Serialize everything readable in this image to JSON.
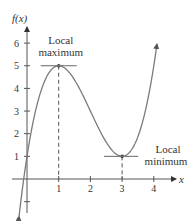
{
  "chart_data": {
    "type": "line",
    "title": "",
    "function": "f(x) = x^3 - 6x^2 + 9x + 1",
    "xlabel": "x",
    "ylabel": "f(x)",
    "x_ticks": [
      1,
      2,
      3,
      4
    ],
    "y_ticks": [
      -1,
      1,
      2,
      3,
      4,
      5,
      6
    ],
    "y_tick_labels": [
      "1",
      "2",
      "3",
      "4",
      "5",
      "6"
    ],
    "x_tick_labels": [
      "1",
      "2",
      "3",
      "4"
    ],
    "xlim": [
      -0.4,
      4.5
    ],
    "ylim": [
      -1.5,
      6.7
    ],
    "grid": false,
    "curve_x_range": [
      -0.25,
      4.1
    ],
    "points": [
      {
        "x": -0.25,
        "y": -1.64
      },
      {
        "x": 0,
        "y": 1
      },
      {
        "x": 1,
        "y": 5
      },
      {
        "x": 2,
        "y": 3
      },
      {
        "x": 3,
        "y": 1
      },
      {
        "x": 4,
        "y": 5
      },
      {
        "x": 4.1,
        "y": 5.96
      }
    ],
    "annotations": [
      {
        "label_line1": "Local",
        "label_line2": "maximum",
        "x": 1,
        "y": 5
      },
      {
        "label_line1": "Local",
        "label_line2": "minimum",
        "x": 3,
        "y": 1
      }
    ],
    "colors": {
      "curve": "#7a7a7a",
      "axis": "#555555",
      "text": "#333333"
    }
  }
}
